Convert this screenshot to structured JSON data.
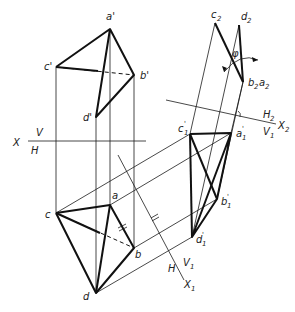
{
  "figure": {
    "type": "descriptive-geometry"
  },
  "axes": {
    "xvh": {
      "x": "X",
      "top": "V",
      "bottom": "H"
    },
    "x1": {
      "left": "H",
      "right": "V",
      "right_sub": "1",
      "axis": "X",
      "axis_sub": "1"
    },
    "x2": {
      "top": "H",
      "top_sub": "2",
      "bottom": "V",
      "bottom_sub": "1",
      "axis": "X",
      "axis_sub": "2"
    }
  },
  "labels": {
    "a_prime": "a'",
    "b_prime": "b'",
    "c_prime": "c'",
    "d_prime": "d'",
    "a": "a",
    "b": "b",
    "c": "c",
    "d": "d",
    "a1": "a",
    "b1": "b",
    "c1": "c",
    "d1": "d",
    "c2": "c",
    "d2": "d",
    "b2a2_b": "b",
    "b2a2_a": "a",
    "sub1": "1",
    "sub2": "2",
    "prime": "'",
    "phi": "φ",
    "equal_mark": "="
  },
  "colors": {
    "line": "#111111",
    "background": "#ffffff"
  }
}
